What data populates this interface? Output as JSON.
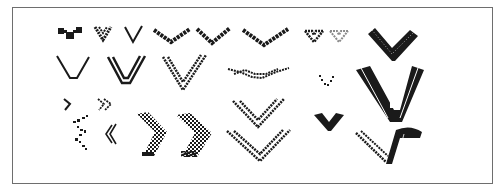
{
  "figure": {
    "ink_color": "#1a1a1a",
    "light_ink_color": "#8a8a8a",
    "frame_color": "#6e6e6e"
  },
  "samples": [
    {
      "id": "r1-block-v",
      "row": 1,
      "x": 58,
      "y": 28,
      "w": 24,
      "h": 12,
      "style": "blocks"
    },
    {
      "id": "r1-small-v",
      "row": 1,
      "x": 94,
      "y": 26,
      "w": 18,
      "h": 16,
      "style": "pixel-thick"
    },
    {
      "id": "r1-thin-v",
      "row": 1,
      "x": 124,
      "y": 26,
      "w": 18,
      "h": 18,
      "style": "thin"
    },
    {
      "id": "r1-wide-v",
      "row": 1,
      "x": 154,
      "y": 28,
      "w": 36,
      "h": 16,
      "style": "jagged"
    },
    {
      "id": "r1-wide-v2",
      "row": 1,
      "x": 196,
      "y": 27,
      "w": 34,
      "h": 18,
      "style": "jagged"
    },
    {
      "id": "r1-wide-v3",
      "row": 1,
      "x": 243,
      "y": 28,
      "w": 44,
      "h": 18,
      "style": "jagged"
    },
    {
      "id": "r1-heart-dark",
      "row": 1,
      "x": 305,
      "y": 30,
      "w": 18,
      "h": 12,
      "style": "hollow-dark"
    },
    {
      "id": "r1-heart-light",
      "row": 1,
      "x": 330,
      "y": 30,
      "w": 18,
      "h": 12,
      "style": "hollow-light"
    },
    {
      "id": "r1-bold-wing",
      "row": 1,
      "x": 368,
      "y": 28,
      "w": 48,
      "h": 32,
      "style": "wing"
    },
    {
      "id": "r2-open-v",
      "row": 2,
      "x": 57,
      "y": 56,
      "w": 32,
      "h": 24,
      "style": "thin"
    },
    {
      "id": "r2-double-v",
      "row": 2,
      "x": 107,
      "y": 56,
      "w": 38,
      "h": 32,
      "style": "double"
    },
    {
      "id": "r2-checker-v",
      "row": 2,
      "x": 162,
      "y": 55,
      "w": 44,
      "h": 36,
      "style": "double-dotted"
    },
    {
      "id": "r2-wave-chain",
      "row": 2,
      "x": 227,
      "y": 66,
      "w": 62,
      "h": 14,
      "style": "chain"
    },
    {
      "id": "r2-dot-v",
      "row": 2,
      "x": 318,
      "y": 75,
      "w": 16,
      "h": 12,
      "style": "dots"
    },
    {
      "id": "r2-big-v",
      "row": 2,
      "x": 356,
      "y": 66,
      "w": 68,
      "h": 58,
      "style": "filled-band"
    },
    {
      "id": "r3-small-arrow",
      "row": 3,
      "x": 63,
      "y": 98,
      "w": 8,
      "h": 12,
      "style": "arrow-right"
    },
    {
      "id": "r3-double-arrow",
      "row": 3,
      "x": 98,
      "y": 98,
      "w": 14,
      "h": 12,
      "style": "double-arrow"
    },
    {
      "id": "r3-dotted-zigzag",
      "row": 3,
      "x": 72,
      "y": 114,
      "w": 18,
      "h": 36,
      "style": "scatter"
    },
    {
      "id": "r3-left-arrows",
      "row": 3,
      "x": 106,
      "y": 124,
      "w": 12,
      "h": 20,
      "style": "arrow-left"
    },
    {
      "id": "r3-checker-chevron-1",
      "row": 3,
      "x": 137,
      "y": 112,
      "w": 30,
      "h": 44,
      "style": "checker-chevron"
    },
    {
      "id": "r3-checker-chevron-2",
      "row": 3,
      "x": 176,
      "y": 113,
      "w": 36,
      "h": 44,
      "style": "checker-chevron"
    },
    {
      "id": "r3-checker-v",
      "row": 3,
      "x": 232,
      "y": 99,
      "w": 52,
      "h": 30,
      "style": "double-dotted"
    },
    {
      "id": "r3-filled-small-v",
      "row": 3,
      "x": 314,
      "y": 113,
      "w": 30,
      "h": 18,
      "style": "filled-small"
    },
    {
      "id": "r4-checker-v-wide",
      "row": 4,
      "x": 226,
      "y": 128,
      "w": 64,
      "h": 34,
      "style": "double-dotted"
    },
    {
      "id": "r4-swoosh",
      "row": 4,
      "x": 355,
      "y": 126,
      "w": 68,
      "h": 38,
      "style": "swoosh"
    }
  ]
}
